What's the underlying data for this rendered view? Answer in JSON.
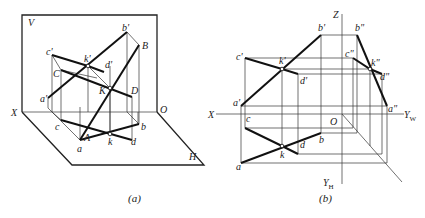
{
  "figure_a": {
    "caption": "(a)",
    "plane_labels": {
      "V": "V",
      "H": "H",
      "X": "X",
      "O": "O"
    },
    "point_labels": {
      "b_prime": "b'",
      "B": "B",
      "c_prime": "c'",
      "k_prime": "k'",
      "d_prime": "d'",
      "C": "C",
      "K": "K",
      "D": "D",
      "a_prime": "a'",
      "c": "c",
      "A": "A",
      "b": "b",
      "k": "k",
      "d": "d",
      "a": "a"
    }
  },
  "figure_b": {
    "caption": "(b)",
    "axis_labels": {
      "Z": "Z",
      "X": "X",
      "O": "O",
      "YW": "Y",
      "YW_sub": "W",
      "YH": "Y",
      "YH_sub": "H"
    },
    "point_labels": {
      "b_prime": "b'",
      "b_dprime": "b\"",
      "c_prime": "c'",
      "k_prime": "k'",
      "d_prime": "d'",
      "c_dprime": "c\"",
      "k_dprime": "k\"",
      "d_dprime": "d\"",
      "a_prime": "a'",
      "a_dprime": "a\"",
      "c": "c",
      "b": "b",
      "d": "d",
      "k": "k",
      "a": "a"
    }
  }
}
